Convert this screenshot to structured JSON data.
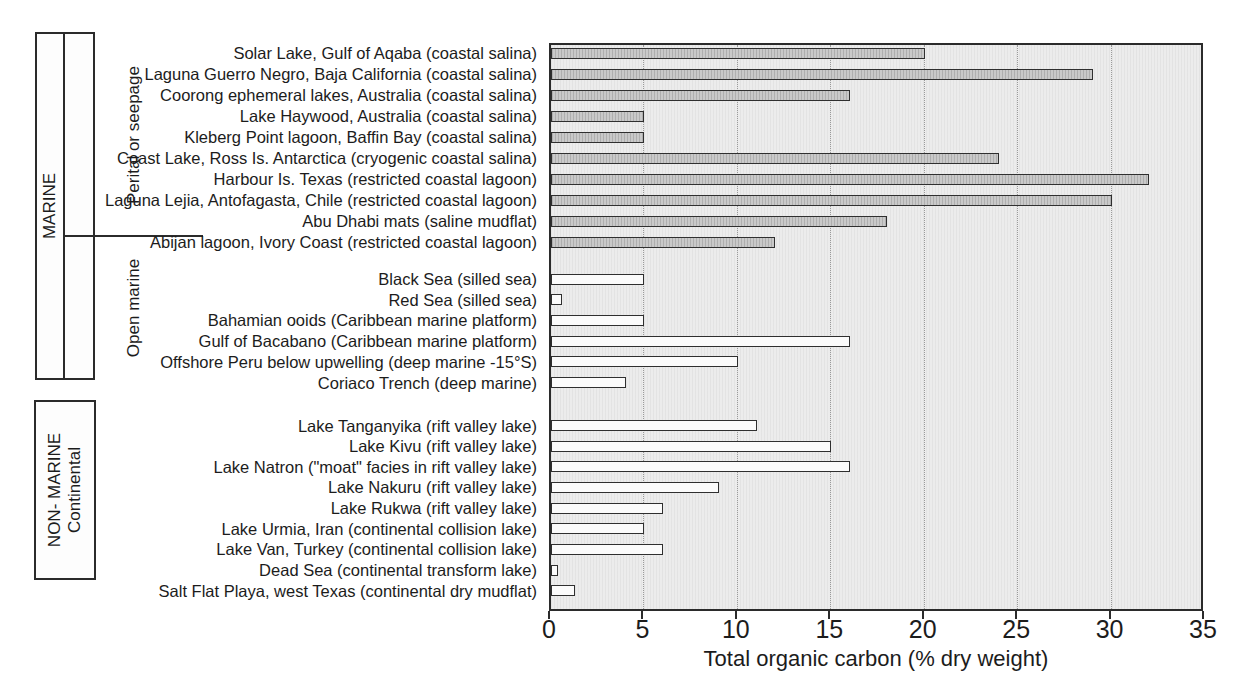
{
  "side_labels": {
    "marine": "MARINE",
    "peritidal": "Perital or seepage",
    "open_marine": "Open marine",
    "non_marine": "NON- MARINE",
    "continental": "Continental"
  },
  "chart_data": {
    "type": "bar",
    "orientation": "horizontal",
    "xlabel": "Total organic carbon (% dry weight)",
    "xlim": [
      0,
      35
    ],
    "xticks": [
      0,
      5,
      10,
      15,
      20,
      25,
      30,
      35
    ],
    "grid": "dotted vertical gridlines every 5 units",
    "legend": "none",
    "groups": [
      {
        "category": "MARINE",
        "subcategory": "Perital or seepage",
        "bar_fill": "gray-hatched",
        "items": [
          {
            "label": "Solar Lake, Gulf of Aqaba (coastal salina)",
            "value": 20
          },
          {
            "label": "Laguna Guerro Negro, Baja California (coastal salina)",
            "value": 29
          },
          {
            "label": "Coorong ephemeral lakes, Australia (coastal salina)",
            "value": 16
          },
          {
            "label": "Lake Haywood, Australia (coastal salina)",
            "value": 5
          },
          {
            "label": "Kleberg Point lagoon, Baffin Bay (coastal salina)",
            "value": 5
          },
          {
            "label": "Coast Lake, Ross Is. Antarctica (cryogenic coastal salina)",
            "value": 24
          },
          {
            "label": "Harbour Is. Texas (restricted coastal lagoon)",
            "value": 32
          },
          {
            "label": "Laguna Lejia, Antofagasta, Chile (restricted coastal lagoon)",
            "value": 30
          },
          {
            "label": "Abu Dhabi mats (saline mudflat)",
            "value": 18
          },
          {
            "label": "Abijan lagoon, Ivory Coast (restricted coastal lagoon)",
            "value": 12
          }
        ]
      },
      {
        "category": "MARINE",
        "subcategory": "Open marine",
        "bar_fill": "white",
        "items": [
          {
            "label": "Black Sea (silled sea)",
            "value": 5
          },
          {
            "label": "Red Sea (silled sea)",
            "value": 0.6
          },
          {
            "label": "Bahamian ooids (Caribbean marine platform)",
            "value": 5
          },
          {
            "label": "Gulf of Bacabano (Caribbean marine platform)",
            "value": 16
          },
          {
            "label": "Offshore Peru below upwelling (deep marine -15°S)",
            "value": 10
          },
          {
            "label": "Coriaco Trench (deep marine)",
            "value": 4
          }
        ]
      },
      {
        "category": "NON- MARINE",
        "subcategory": "Continental",
        "bar_fill": "white",
        "items": [
          {
            "label": "Lake Tanganyika (rift valley lake)",
            "value": 11
          },
          {
            "label": "Lake Kivu (rift valley lake)",
            "value": 15
          },
          {
            "label": "Lake Natron (\"moat\" facies in rift valley lake)",
            "value": 16
          },
          {
            "label": "Lake Nakuru (rift valley lake)",
            "value": 9
          },
          {
            "label": "Lake Rukwa (rift valley lake)",
            "value": 6
          },
          {
            "label": "Lake Urmia, Iran (continental collision lake)",
            "value": 5
          },
          {
            "label": "Lake Van, Turkey (continental collision lake)",
            "value": 6
          },
          {
            "label": "Dead Sea (continental transform lake)",
            "value": 0.4
          },
          {
            "label": "Salt Flat Playa, west Texas (continental dry mudflat)",
            "value": 1.3
          }
        ]
      }
    ]
  },
  "colors": {
    "bar_gray": "#c9c9c9",
    "bar_white": "#fbfbfb",
    "bar_outline": "#2f2f2f",
    "plot_background": "#ececec",
    "gridline": "#9a9a9a",
    "text": "#1c1c1c",
    "box_border": "#2b2b2b"
  }
}
